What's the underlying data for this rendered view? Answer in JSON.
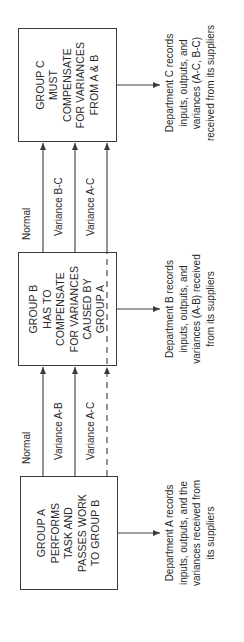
{
  "diagram": {
    "groups": [
      {
        "id": "A",
        "box_lines": [
          "GROUP A",
          "PERFORMS",
          "TASK AND",
          "PASSES WORK",
          "TO GROUP B"
        ],
        "description_lines": [
          "Department A records",
          "inputs, outputs, and the",
          "variances received from",
          "its suppliers"
        ]
      },
      {
        "id": "B",
        "box_lines": [
          "GROUP B",
          "HAS TO",
          "COMPENSATE",
          "FOR VARIANCES",
          "CAUSED BY",
          "GROUP A"
        ],
        "description_lines": [
          "Department B records",
          "inputs, outputs, and",
          "variances (A-B) received",
          "from its suppliers"
        ]
      },
      {
        "id": "C",
        "box_lines": [
          "GROUP C",
          "MUST",
          "COMPENSATE",
          "FOR VARIANCES",
          "FROM A & B"
        ],
        "description_lines": [
          "Department C records",
          "inputs, outputs, and",
          "variances (A-C, B-C)",
          "received from its suppliers"
        ]
      }
    ],
    "flows_a_to_b": [
      {
        "label": "Normal",
        "style": "solid"
      },
      {
        "label": "Variance A-B",
        "style": "solid"
      },
      {
        "label": "Variance A-C",
        "style": "dashed"
      }
    ],
    "flows_b_to_c": [
      {
        "label": "Normal",
        "style": "solid"
      },
      {
        "label": "Variance B-C",
        "style": "solid"
      },
      {
        "label": "Variance A-C",
        "style": "solid"
      }
    ],
    "colors": {
      "line": "#3a3a3a",
      "text": "#2a2a2a",
      "background": "#ffffff"
    }
  }
}
